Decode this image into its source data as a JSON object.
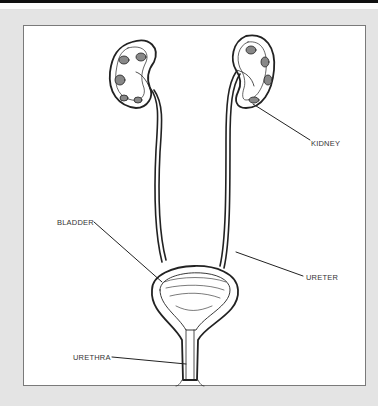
{
  "diagram": {
    "labels": {
      "kidney": "KIDNEY",
      "bladder": "BLADDER",
      "ureter": "URETER",
      "urethra": "URETHRA"
    }
  },
  "colors": {
    "frame": "#e4e4e4",
    "panel": "#ffffff",
    "ink": "#222222",
    "topbar": "#111111"
  }
}
